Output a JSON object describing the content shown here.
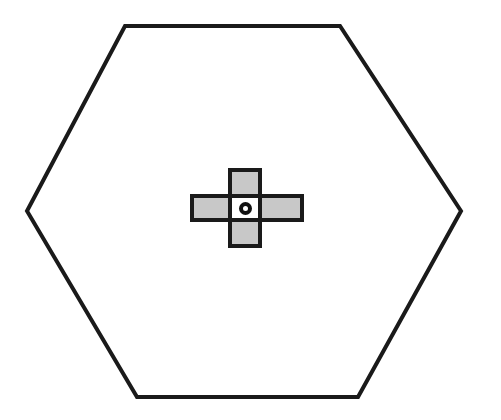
{
  "board": {
    "shape": "hexagon",
    "outline_color": "#1a1a1a",
    "fill_color": "#ffffff",
    "vertices": [
      [
        125,
        26
      ],
      [
        340,
        26
      ],
      [
        461,
        211
      ],
      [
        358,
        397
      ],
      [
        137,
        397
      ],
      [
        27,
        211
      ]
    ]
  },
  "cross": {
    "tile_fill": "#c8c8c8",
    "border_color": "#1a1a1a",
    "tiles": [
      {
        "name": "tile-top",
        "x": 228,
        "y": 168,
        "w": 34,
        "h": 30
      },
      {
        "name": "tile-left",
        "x": 190,
        "y": 194,
        "w": 42,
        "h": 28
      },
      {
        "name": "tile-right",
        "x": 258,
        "y": 194,
        "w": 46,
        "h": 28
      },
      {
        "name": "tile-bottom",
        "x": 228,
        "y": 218,
        "w": 34,
        "h": 30
      }
    ],
    "center": {
      "x": 228,
      "y": 194,
      "w": 34,
      "h": 28,
      "marker": "o"
    }
  }
}
